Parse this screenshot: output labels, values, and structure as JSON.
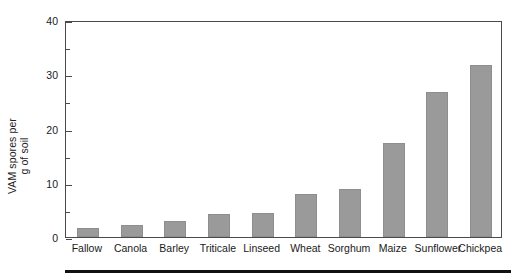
{
  "chart_data": {
    "type": "bar",
    "title": "",
    "xlabel": "",
    "ylabel": "VAM spores per g of soil",
    "ylabel_lines": [
      "VAM spores per",
      "g of soil"
    ],
    "categories": [
      "Fallow",
      "Canola",
      "Barley",
      "Triticale",
      "Linseed",
      "Wheat",
      "Sorghum",
      "Maize",
      "Sunflower",
      "Chickpea"
    ],
    "values": [
      1.7,
      2.2,
      3.0,
      4.3,
      4.5,
      7.9,
      8.8,
      17.3,
      26.7,
      31.7
    ],
    "ylim": [
      0,
      40
    ],
    "ytick_labels": [
      "0",
      "10",
      "20",
      "30",
      "40"
    ],
    "ytick_values": [
      0,
      10,
      20,
      30,
      40
    ],
    "yminor_values": [
      5,
      15,
      25,
      35
    ],
    "grid": false,
    "legend": false,
    "bar_color": "#9a9a9a",
    "axis_color": "#4a4a4a",
    "rule_color": "#111111"
  }
}
